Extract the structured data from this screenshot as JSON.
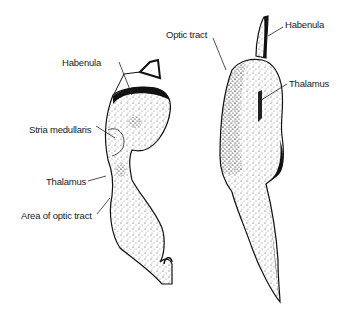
{
  "figure": {
    "type": "anatomical line drawing",
    "colors": {
      "ink": "#111111",
      "background": "#ffffff"
    },
    "specimens": [
      {
        "id": "left",
        "labels": [
          {
            "text": "Habenula",
            "x": 62,
            "y": 58
          },
          {
            "text": "Stria medullaris",
            "x": 29,
            "y": 125
          },
          {
            "text": "Thalamus",
            "x": 46,
            "y": 177
          },
          {
            "text": "Area of optic tract",
            "x": 21,
            "y": 211
          }
        ]
      },
      {
        "id": "right",
        "labels": [
          {
            "text": "Optic tract",
            "x": 166,
            "y": 30
          },
          {
            "text": "Habenula",
            "x": 285,
            "y": 20
          },
          {
            "text": "Thalamus",
            "x": 289,
            "y": 79
          }
        ]
      }
    ]
  }
}
